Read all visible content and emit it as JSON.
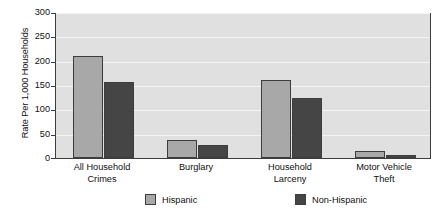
{
  "chart_data": {
    "type": "bar",
    "title": "",
    "xlabel": "",
    "ylabel": "Rate Per 1,000 Households",
    "ylim": [
      0,
      300
    ],
    "yticks": [
      300,
      250,
      200,
      150,
      100,
      50,
      0
    ],
    "grid": true,
    "legend_position": "bottom",
    "categories": [
      "All Household Crimes",
      "Burglary",
      "Household Larceny",
      "Motor Vehicle Theft"
    ],
    "category_lines": [
      [
        "All Household",
        "Crimes"
      ],
      [
        "Burglary",
        ""
      ],
      [
        "Household",
        "Larceny"
      ],
      [
        "Motor Vehicle",
        "Theft"
      ]
    ],
    "series": [
      {
        "name": "Hispanic",
        "color": "#a8a8a8",
        "values": [
          209,
          38,
          160,
          14
        ]
      },
      {
        "name": "Non-Hispanic",
        "color": "#454545",
        "values": [
          157,
          27,
          123,
          7
        ]
      }
    ],
    "colors": {
      "plot_background": "#e0e0e0",
      "gridline": "#f4f4f4",
      "axis": "#3d3d3d",
      "page_background": "#ffffff",
      "text": "#111111"
    }
  }
}
